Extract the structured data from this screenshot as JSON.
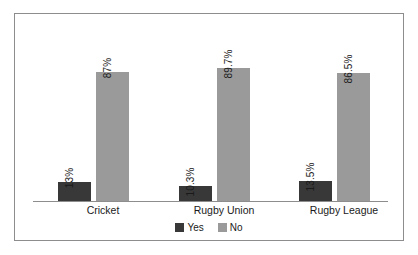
{
  "chart_data": {
    "type": "bar",
    "title": "",
    "subtitle": "",
    "xlabel": "",
    "ylabel": "",
    "ylim": [
      0,
      100
    ],
    "grid": false,
    "legend_position": "bottom-center",
    "orientation": "vertical",
    "grouping": "grouped",
    "categories": [
      "Cricket",
      "Rugby Union",
      "Rugby League"
    ],
    "series": [
      {
        "name": "Yes",
        "color": "#383838",
        "values": [
          13,
          10.3,
          13.5
        ],
        "labels": [
          "13%",
          "10.3%",
          "13.5%"
        ]
      },
      {
        "name": "No",
        "color": "#9a9a9a",
        "values": [
          87,
          89.7,
          86.5
        ],
        "labels": [
          "87%",
          "89.7%",
          "86.5%"
        ]
      }
    ],
    "annotations": []
  },
  "legend": {
    "items": [
      {
        "label": "Yes",
        "color": "#383838"
      },
      {
        "label": "No",
        "color": "#9a9a9a"
      }
    ]
  },
  "colors": {
    "series_yes": "#383838",
    "series_no": "#9a9a9a",
    "frame": "#8d8d8d",
    "axis": "#8d8d8d",
    "text": "#1a1a1a",
    "background": "#ffffff"
  }
}
